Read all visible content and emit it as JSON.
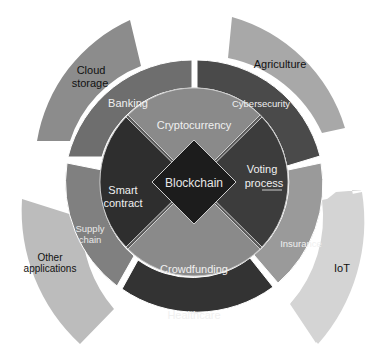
{
  "diagram": {
    "center": {
      "label": "Blockchain"
    },
    "inner": [
      {
        "label": "Cryptocurrency",
        "color": "#8a8a8a"
      },
      {
        "label_lines": [
          "Voting",
          "process"
        ],
        "color": "#3c3c3c"
      },
      {
        "label": "Crowdfunding",
        "color": "#8a8a8a"
      },
      {
        "label_lines": [
          "Smart",
          "contract"
        ],
        "color": "#2e2e2e"
      }
    ],
    "middle": [
      {
        "label": "Banking",
        "color": "#6e6e6e"
      },
      {
        "label": "Cybersecurity",
        "color": "#4a4a4a"
      },
      {
        "label": "Insurance",
        "color": "#9a9a9a"
      },
      {
        "label": "Healthcare",
        "color": "#333333"
      },
      {
        "label_lines": [
          "Supply",
          "chain"
        ],
        "color": "#808080"
      }
    ],
    "outer": [
      {
        "label_lines": [
          "Cloud",
          "storage"
        ],
        "color": "#8c8c8c"
      },
      {
        "label": "Agriculture",
        "color": "#a8a8a8"
      },
      {
        "label": "IoT",
        "color": "#d4d4d4"
      },
      {
        "label_lines": [
          "Other",
          "applications"
        ],
        "color": "#bcbcbc"
      }
    ]
  }
}
